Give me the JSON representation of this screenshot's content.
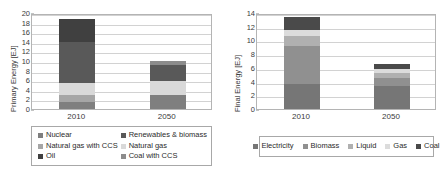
{
  "charts": [
    {
      "id": "primary-energy",
      "ylabel": "Primary Energy [EJ]",
      "yticks": [
        "0",
        "2",
        "4",
        "6",
        "8",
        "10",
        "12",
        "14",
        "16",
        "18",
        "20"
      ],
      "xticks": [
        "2010",
        "2050"
      ],
      "legend": [
        {
          "label": "Nuclear",
          "color": "#7f7f7f"
        },
        {
          "label": "Renewables & biomass",
          "color": "#595959"
        },
        {
          "label": "Natural gas with CCS",
          "color": "#a6a6a6"
        },
        {
          "label": "Natural gas",
          "color": "#d9d9d9"
        },
        {
          "label": "Oil",
          "color": "#404040"
        },
        {
          "label": "Coal with CCS",
          "color": "#8c8c8c"
        }
      ]
    },
    {
      "id": "final-energy",
      "ylabel": "Final Energy [EJ]",
      "yticks": [
        "0",
        "2",
        "4",
        "6",
        "8",
        "10",
        "12",
        "14"
      ],
      "xticks": [
        "2010",
        "2050"
      ],
      "legend": [
        {
          "label": "Electricity",
          "color": "#767676"
        },
        {
          "label": "Biomass",
          "color": "#909090"
        },
        {
          "label": "Liquid",
          "color": "#b0b0b0"
        },
        {
          "label": "Gas",
          "color": "#dcdcdc"
        },
        {
          "label": "Coal",
          "color": "#4a4a4a"
        }
      ]
    }
  ],
  "chart_data": [
    {
      "type": "bar",
      "id": "primary-energy",
      "stacked": true,
      "title": "",
      "xlabel": "",
      "ylabel": "Primary Energy [EJ]",
      "ylim": [
        0,
        20
      ],
      "ytick_step": 2,
      "grid": true,
      "legend_position": "bottom",
      "categories": [
        "2010",
        "2050"
      ],
      "series": [
        {
          "name": "Nuclear",
          "color": "#7f7f7f",
          "values": [
            1.5,
            2.9
          ]
        },
        {
          "name": "Natural gas with CCS",
          "color": "#a6a6a6",
          "values": [
            1.5,
            0.0
          ]
        },
        {
          "name": "Natural gas",
          "color": "#d9d9d9",
          "values": [
            2.5,
            2.9
          ]
        },
        {
          "name": "Renewables & biomass",
          "color": "#595959",
          "values": [
            8.5,
            3.4
          ]
        },
        {
          "name": "Oil",
          "color": "#404040",
          "values": [
            4.7,
            0.0
          ]
        },
        {
          "name": "Coal with CCS",
          "color": "#8c8c8c",
          "values": [
            0.0,
            0.8
          ]
        }
      ],
      "totals": [
        18.7,
        10.0
      ]
    },
    {
      "type": "bar",
      "id": "final-energy",
      "stacked": true,
      "title": "",
      "xlabel": "",
      "ylabel": "Final Energy [EJ]",
      "ylim": [
        0,
        14
      ],
      "ytick_step": 2,
      "grid": true,
      "legend_position": "bottom",
      "categories": [
        "2010",
        "2050"
      ],
      "series": [
        {
          "name": "Electricity",
          "color": "#767676",
          "values": [
            3.6,
            3.4
          ]
        },
        {
          "name": "Biomass",
          "color": "#909090",
          "values": [
            5.6,
            1.1
          ]
        },
        {
          "name": "Liquid",
          "color": "#b0b0b0",
          "values": [
            1.4,
            0.8
          ]
        },
        {
          "name": "Gas",
          "color": "#dcdcdc",
          "values": [
            0.9,
            0.5
          ]
        },
        {
          "name": "Coal",
          "color": "#4a4a4a",
          "values": [
            1.9,
            0.7
          ]
        }
      ],
      "totals": [
        13.4,
        6.5
      ]
    }
  ]
}
